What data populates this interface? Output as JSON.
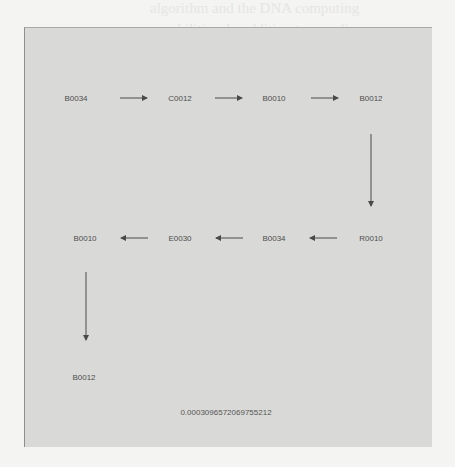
{
  "bleed_through_text": [
    "algorithm and the DNA computing",
    "capabilities. In addition to speeding up",
    "n of a sequence is also a possible",
    "automate DNA assembly process as well as",
    "defining a calculation at each step of",
    "computation based on its previous outcome.",
    "stage-restricted computations and thus is well",
    "for autonomous graph computation bio",
    "s in this paper signifies that which",
    "ist and the path next to it which",
    "the physical world. For example, a",
    "associated with its neighbors, but",
    "enhance sequence computation the",
    "should still be introduced. Hence that"
  ],
  "diagram": {
    "nodes": [
      {
        "id": "n1",
        "label": "B0034",
        "x": 76,
        "y": 98
      },
      {
        "id": "n2",
        "label": "C0012",
        "x": 180,
        "y": 98
      },
      {
        "id": "n3",
        "label": "B0010",
        "x": 274,
        "y": 98
      },
      {
        "id": "n4",
        "label": "B0012",
        "x": 371,
        "y": 98
      },
      {
        "id": "n5",
        "label": "R0010",
        "x": 371,
        "y": 238
      },
      {
        "id": "n6",
        "label": "B0034",
        "x": 274,
        "y": 238
      },
      {
        "id": "n7",
        "label": "E0030",
        "x": 180,
        "y": 238
      },
      {
        "id": "n8",
        "label": "B0010",
        "x": 85,
        "y": 238
      },
      {
        "id": "n9",
        "label": "B0012",
        "x": 85,
        "y": 377
      }
    ],
    "edges": [
      {
        "from": "n1",
        "to": "n2"
      },
      {
        "from": "n2",
        "to": "n3"
      },
      {
        "from": "n3",
        "to": "n4"
      },
      {
        "from": "n4",
        "to": "n5"
      },
      {
        "from": "n5",
        "to": "n6"
      },
      {
        "from": "n6",
        "to": "n7"
      },
      {
        "from": "n7",
        "to": "n8"
      },
      {
        "from": "n8",
        "to": "n9"
      }
    ],
    "probability_value": "0.0003096572069755212"
  },
  "colors": {
    "page": "#f4f4f2",
    "panel": "#d9d9d7",
    "node_text": "#4d4d4d",
    "arrow": "#4a4a4a"
  }
}
